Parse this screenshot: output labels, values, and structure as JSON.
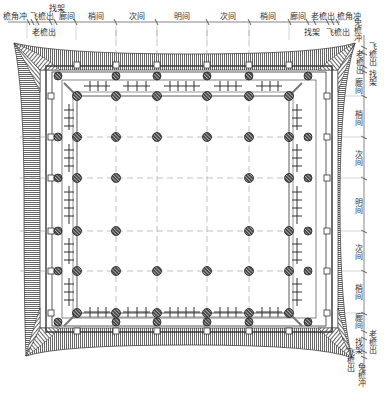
{
  "diagram": {
    "type": "architectural-floor-plan",
    "top_dimension_labels": {
      "upper_row": [
        "檐角冲",
        "飞檐出",
        "找架",
        "廊间",
        "梢间",
        "次间",
        "明间",
        "次间",
        "梢间",
        "廊间",
        "老檐出",
        "檐角冲"
      ],
      "lower_row": [
        "老檐出",
        "找架",
        "飞檐出"
      ]
    },
    "right_dimension_labels": {
      "top": [
        "免檐冲",
        "飞檐出",
        "老檐出",
        "找架"
      ],
      "bays": [
        "廊间",
        "梢间",
        "次间",
        "明间",
        "次间",
        "梢间",
        "廊间"
      ],
      "bottom": [
        "老檐出",
        "找架",
        "飞檐出",
        "免檐冲"
      ]
    },
    "grid": {
      "columns_x": [
        77,
        116,
        157,
        207,
        249,
        289
      ],
      "rows_y": [
        96,
        137,
        178,
        231,
        271,
        313
      ]
    },
    "colors": {
      "line": "#333333",
      "rafter_hatch": "#555555",
      "column_fill": "#444444",
      "grid_dash": "#999999",
      "background": "#ffffff"
    }
  }
}
